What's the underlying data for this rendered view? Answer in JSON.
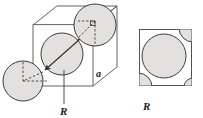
{
  "figure": {
    "title": "",
    "background_color": "#ffffff",
    "sphere_fill": "#e2e1df",
    "sphere_stroke": "#3c3c3c",
    "line_color": "#4a4a4a",
    "dash_color": "#3a3a3a",
    "panels": [
      {
        "id": "unit-cell",
        "type": "3d-cube-with-spheres",
        "labels": [
          {
            "name": "edge-length-label",
            "text": "a",
            "x": 99,
            "y": 74
          },
          {
            "name": "radius-label",
            "text": "R",
            "x": 63,
            "y": 112
          }
        ],
        "spheres": [
          {
            "name": "corner-sphere-bottom-left",
            "cx": 23,
            "cy": 81,
            "r": 20
          },
          {
            "name": "center-sphere",
            "cx": 62,
            "cy": 54,
            "r": 21
          },
          {
            "name": "corner-sphere-top-right",
            "cx": 95,
            "cy": 25,
            "r": 21
          }
        ],
        "annotations": [
          {
            "name": "body-diagonal-arrow",
            "text": ""
          },
          {
            "name": "right-angle-marker",
            "text": ""
          },
          {
            "name": "leader-line-to-R",
            "text": ""
          }
        ]
      },
      {
        "id": "face-view",
        "type": "square-face-with-spheres",
        "labels": [
          {
            "name": "radius-label",
            "text": "R",
            "x": 146,
            "y": 110
          }
        ],
        "square": {
          "x": 139,
          "y": 29,
          "w": 53,
          "h": 57
        },
        "spheres": [
          {
            "name": "face-center-sphere",
            "cx": 163,
            "cy": 56,
            "r": 22
          },
          {
            "name": "corner-arc-top-right",
            "cx": 192,
            "cy": 29,
            "r": 13
          },
          {
            "name": "corner-arc-bottom-left",
            "cx": 139,
            "cy": 86,
            "r": 13
          }
        ]
      }
    ]
  }
}
